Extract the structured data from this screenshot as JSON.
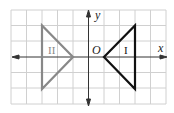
{
  "diagram": {
    "type": "coordinate-plane-reflection",
    "grid": {
      "columns": 10,
      "rows": 6,
      "color": "#d0d0d0"
    },
    "axes": {
      "x_label": "x",
      "y_label": "y",
      "origin_label": "O",
      "color": "#333333"
    },
    "triangles": [
      {
        "label": "I",
        "color": "#111111",
        "vertices_grid": [
          [
            1,
            0
          ],
          [
            3,
            2
          ],
          [
            3,
            -2
          ]
        ]
      },
      {
        "label": "II",
        "color": "#888888",
        "vertices_grid": [
          [
            -3,
            2
          ],
          [
            -3,
            -2
          ],
          [
            -1,
            0
          ]
        ]
      }
    ]
  }
}
